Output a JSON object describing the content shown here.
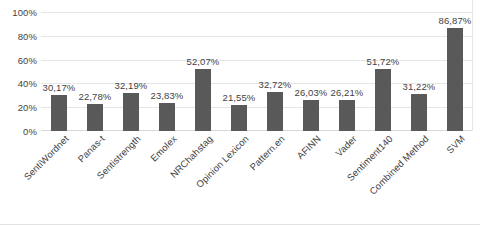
{
  "chart_data": {
    "type": "bar",
    "title": "",
    "subtitle": "",
    "xlabel": "",
    "ylabel": "",
    "ylim": [
      0,
      100
    ],
    "grid": true,
    "legend": false,
    "value_suffix": "%",
    "decimal_separator": ",",
    "bar_color": "#595959",
    "gridline_color": "#e6e6e6",
    "text_color": "#3f3f3f",
    "categories": [
      "SentiWordnet",
      "Panas-t",
      "Sentistrength",
      "Emolex",
      "NRChahstag",
      "Opinion Lexicon",
      "Pattern.en",
      "AFINN",
      "Vader",
      "Sentiment140",
      "Combined Method",
      "SVM"
    ],
    "values": [
      30.17,
      22.78,
      32.19,
      23.83,
      52.07,
      21.55,
      32.72,
      26.03,
      26.21,
      51.72,
      31.22,
      86.87
    ],
    "value_labels": [
      "30,17%",
      "22,78%",
      "32,19%",
      "23,83%",
      "52,07%",
      "21,55%",
      "32,72%",
      "26,03%",
      "26,21%",
      "51,72%",
      "31,22%",
      "86,87%"
    ],
    "y_ticks": [
      0,
      20,
      40,
      60,
      80,
      100
    ],
    "y_tick_labels": [
      "0%",
      "20%",
      "40%",
      "60%",
      "80%",
      "100%"
    ]
  }
}
